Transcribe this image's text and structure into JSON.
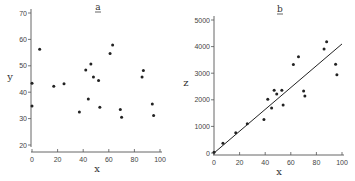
{
  "chart_data": [
    {
      "panel": "a",
      "type": "scatter",
      "title": "a",
      "xlabel": "x",
      "ylabel": "y",
      "xlim": [
        0,
        100
      ],
      "ylim": [
        20,
        70
      ],
      "xticks": [
        0,
        20,
        40,
        60,
        80,
        100
      ],
      "yticks": [
        20,
        30,
        40,
        50,
        60,
        70
      ],
      "grid": false,
      "points": [
        {
          "x": 0,
          "y": 43.4
        },
        {
          "x": 0,
          "y": 34.8
        },
        {
          "x": 6,
          "y": 56.3
        },
        {
          "x": 17,
          "y": 42.3
        },
        {
          "x": 25,
          "y": 43.2
        },
        {
          "x": 37,
          "y": 32.5
        },
        {
          "x": 42,
          "y": 48.4
        },
        {
          "x": 44,
          "y": 37.4
        },
        {
          "x": 46,
          "y": 50.7
        },
        {
          "x": 48,
          "y": 45.8
        },
        {
          "x": 52,
          "y": 44.4
        },
        {
          "x": 53,
          "y": 34.3
        },
        {
          "x": 61,
          "y": 54.7
        },
        {
          "x": 63,
          "y": 57.9
        },
        {
          "x": 69,
          "y": 33.4
        },
        {
          "x": 70,
          "y": 30.5
        },
        {
          "x": 86,
          "y": 45.8
        },
        {
          "x": 87,
          "y": 48.2
        },
        {
          "x": 94,
          "y": 35.5
        },
        {
          "x": 95,
          "y": 31.2
        }
      ]
    },
    {
      "panel": "b",
      "type": "scatter",
      "title": "b",
      "xlabel": "x",
      "ylabel": "z",
      "xlim": [
        0,
        100
      ],
      "ylim": [
        0,
        5000
      ],
      "xticks": [
        0,
        20,
        40,
        60,
        80,
        100
      ],
      "yticks": [
        0,
        1000,
        2000,
        3000,
        4000,
        5000
      ],
      "grid": false,
      "fit_line": {
        "x0": 0,
        "y0": 0,
        "x1": 100,
        "y1": 4100
      },
      "points": [
        {
          "x": 0,
          "y": 30
        },
        {
          "x": 7,
          "y": 370
        },
        {
          "x": 17,
          "y": 760
        },
        {
          "x": 26,
          "y": 1100
        },
        {
          "x": 39,
          "y": 1260
        },
        {
          "x": 42,
          "y": 2020
        },
        {
          "x": 45,
          "y": 1690
        },
        {
          "x": 47,
          "y": 2360
        },
        {
          "x": 49,
          "y": 2220
        },
        {
          "x": 53,
          "y": 2360
        },
        {
          "x": 54,
          "y": 1800
        },
        {
          "x": 62,
          "y": 3330
        },
        {
          "x": 66,
          "y": 3620
        },
        {
          "x": 70,
          "y": 2330
        },
        {
          "x": 71,
          "y": 2140
        },
        {
          "x": 86,
          "y": 3910
        },
        {
          "x": 88,
          "y": 4180
        },
        {
          "x": 95,
          "y": 3340
        },
        {
          "x": 96,
          "y": 2940
        }
      ]
    }
  ],
  "colors": {
    "ink": "#222222",
    "axis": "#555555",
    "background": "#ffffff"
  }
}
